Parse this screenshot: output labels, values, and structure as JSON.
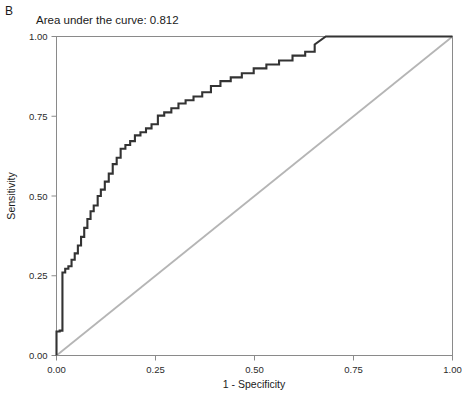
{
  "panel": {
    "label": "B"
  },
  "chart_data": {
    "type": "line",
    "title": "Area under the curve: 0.812",
    "xlabel": "1 - Specificity",
    "ylabel": "Sensitivity",
    "xlim": [
      0,
      1
    ],
    "ylim": [
      0,
      1
    ],
    "grid": false,
    "legend": "none",
    "auc": 0.812,
    "xticks": [
      0,
      0.25,
      0.5,
      0.75,
      1
    ],
    "xtick_labels": [
      "0.00",
      "0.25",
      "0.50",
      "0.75",
      "1.00"
    ],
    "yticks": [
      0,
      0.25,
      0.5,
      0.75,
      1
    ],
    "ytick_labels": [
      "0.00",
      "0.25",
      "0.50",
      "0.75",
      "1.00"
    ],
    "series": [
      {
        "name": "ROC curve",
        "color": "#333333",
        "width": 2.1,
        "x": [
          0.0,
          0.0,
          0.008,
          0.008,
          0.015,
          0.015,
          0.022,
          0.022,
          0.03,
          0.03,
          0.038,
          0.038,
          0.046,
          0.046,
          0.054,
          0.054,
          0.062,
          0.062,
          0.07,
          0.07,
          0.078,
          0.078,
          0.086,
          0.086,
          0.094,
          0.094,
          0.104,
          0.104,
          0.112,
          0.112,
          0.122,
          0.122,
          0.132,
          0.132,
          0.142,
          0.142,
          0.152,
          0.152,
          0.162,
          0.162,
          0.174,
          0.174,
          0.186,
          0.186,
          0.198,
          0.198,
          0.212,
          0.212,
          0.226,
          0.226,
          0.24,
          0.24,
          0.256,
          0.256,
          0.272,
          0.272,
          0.29,
          0.29,
          0.308,
          0.308,
          0.326,
          0.326,
          0.346,
          0.346,
          0.368,
          0.368,
          0.39,
          0.39,
          0.414,
          0.414,
          0.44,
          0.44,
          0.468,
          0.468,
          0.498,
          0.498,
          0.53,
          0.53,
          0.562,
          0.562,
          0.596,
          0.596,
          0.628,
          0.628,
          0.652,
          0.652,
          0.68,
          1.0
        ],
        "y": [
          0.0,
          0.075,
          0.075,
          0.078,
          0.078,
          0.26,
          0.26,
          0.272,
          0.272,
          0.28,
          0.28,
          0.3,
          0.3,
          0.32,
          0.32,
          0.345,
          0.345,
          0.372,
          0.372,
          0.4,
          0.4,
          0.428,
          0.428,
          0.452,
          0.452,
          0.47,
          0.47,
          0.5,
          0.5,
          0.52,
          0.52,
          0.545,
          0.545,
          0.57,
          0.57,
          0.6,
          0.6,
          0.62,
          0.62,
          0.648,
          0.648,
          0.66,
          0.66,
          0.672,
          0.672,
          0.69,
          0.69,
          0.7,
          0.7,
          0.712,
          0.712,
          0.725,
          0.725,
          0.752,
          0.752,
          0.762,
          0.762,
          0.775,
          0.775,
          0.79,
          0.79,
          0.8,
          0.8,
          0.812,
          0.812,
          0.825,
          0.825,
          0.845,
          0.845,
          0.86,
          0.86,
          0.872,
          0.872,
          0.885,
          0.885,
          0.9,
          0.9,
          0.912,
          0.912,
          0.925,
          0.925,
          0.94,
          0.94,
          0.952,
          0.952,
          0.975,
          1.0,
          1.0
        ]
      },
      {
        "name": "Reference diagonal",
        "color": "#b5b5b5",
        "width": 1.8,
        "x": [
          0,
          1
        ],
        "y": [
          0,
          1
        ]
      }
    ]
  }
}
